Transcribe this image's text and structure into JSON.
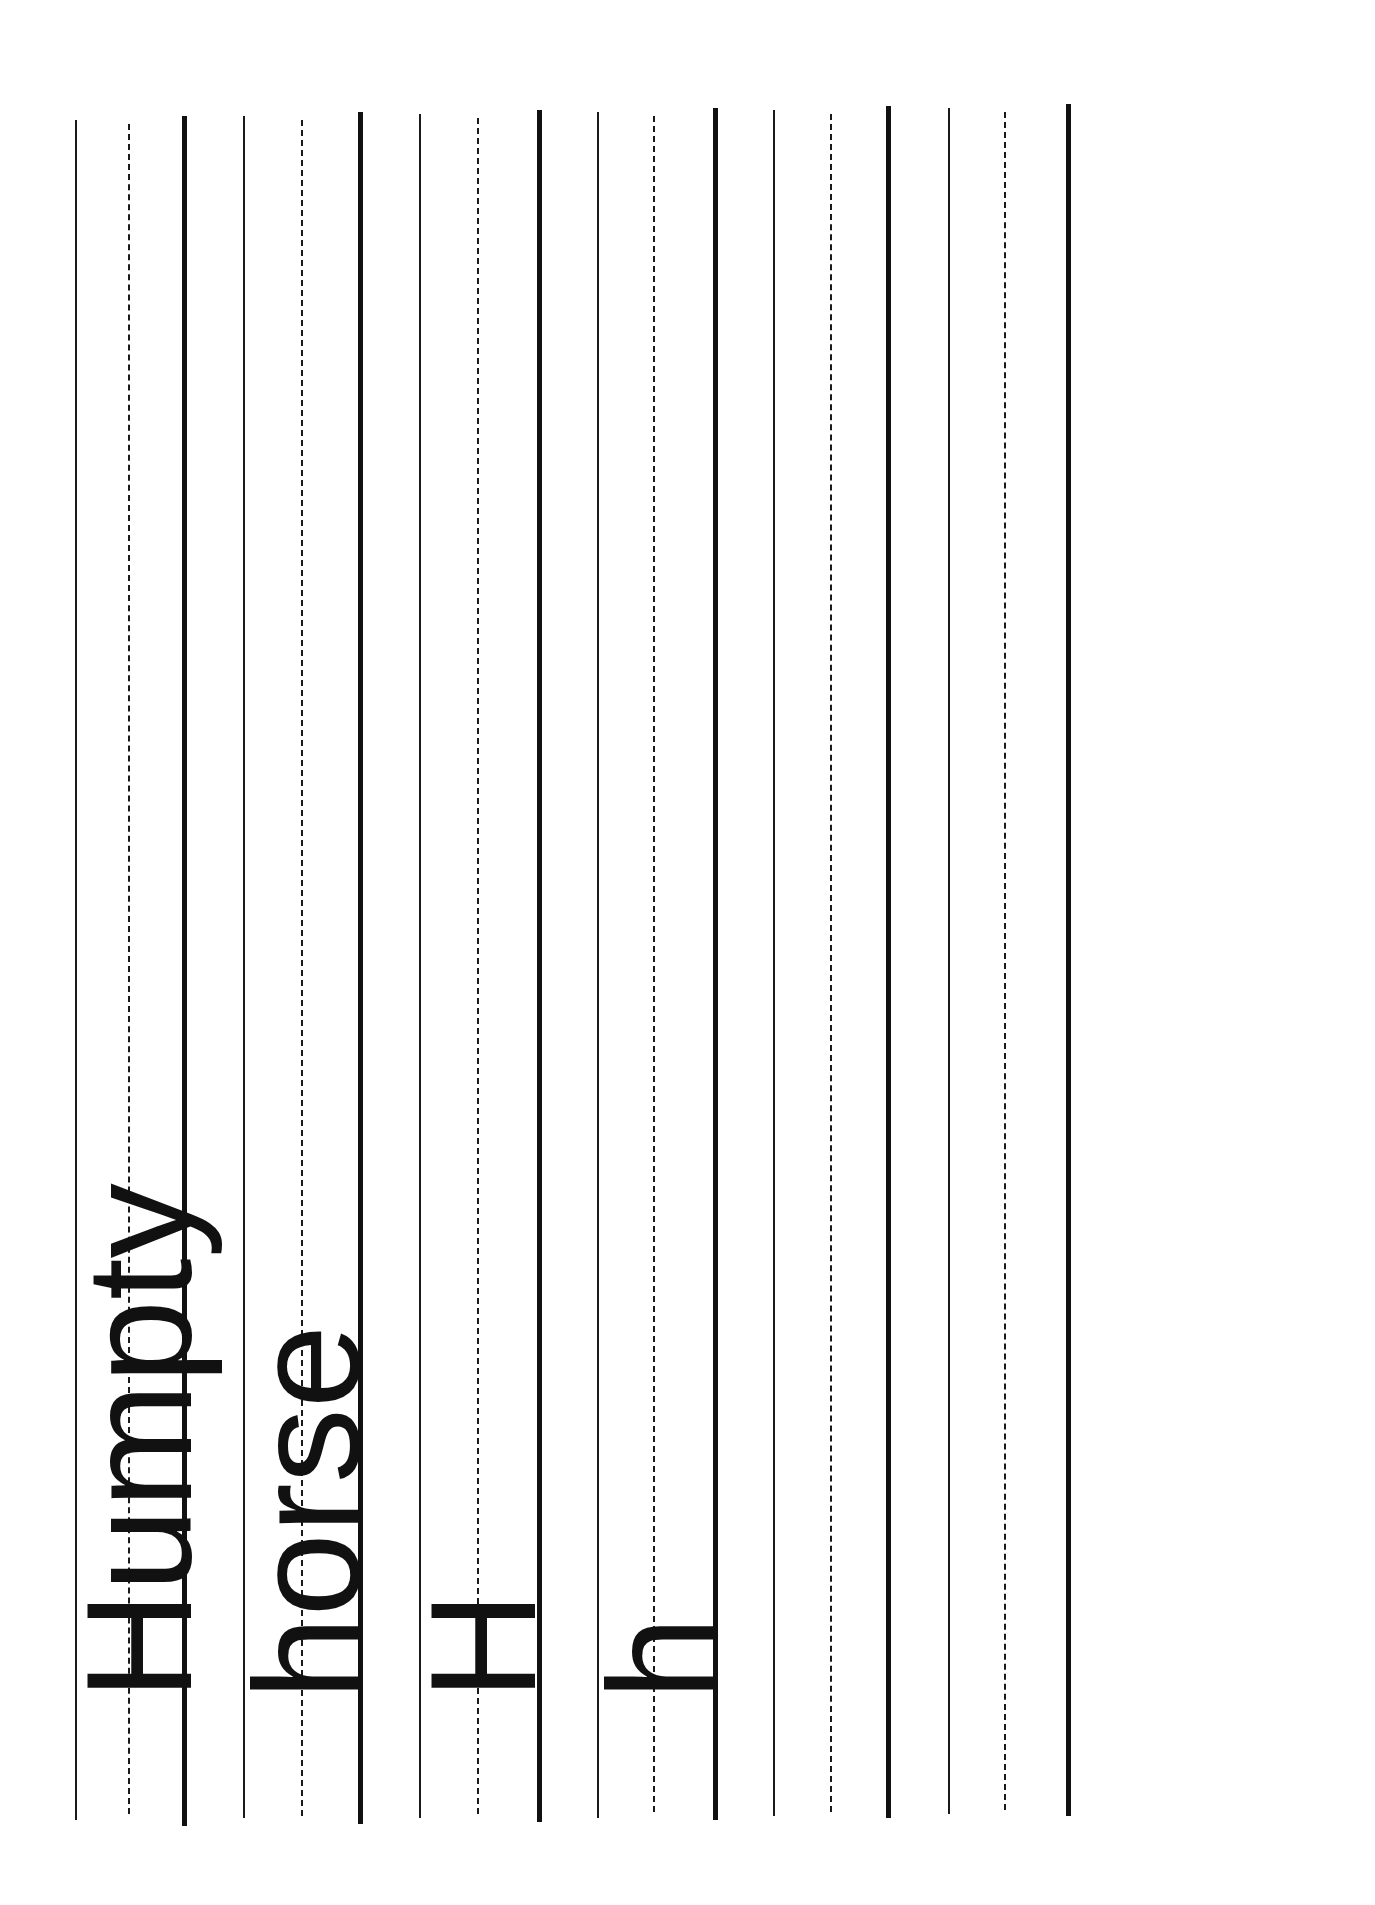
{
  "worksheet": {
    "orientation": "rotated-90-ccw",
    "rows": [
      {
        "id": "row-1",
        "model_text": "Humpty",
        "lines": {
          "top": 75,
          "mid": 129,
          "base": 186
        }
      },
      {
        "id": "row-2",
        "model_text": "horse",
        "lines": {
          "top": 243,
          "mid": 302,
          "base": 362
        }
      },
      {
        "id": "row-3",
        "model_text": "H",
        "lines": {
          "top": 419,
          "mid": 478,
          "base": 541
        }
      },
      {
        "id": "row-4",
        "model_text": "h",
        "lines": {
          "top": 597,
          "mid": 654,
          "base": 717
        }
      },
      {
        "id": "row-5",
        "model_text": "",
        "lines": {
          "top": 773,
          "mid": 830,
          "base": 890
        }
      },
      {
        "id": "row-6",
        "model_text": "",
        "lines": {
          "top": 948,
          "mid": 1005,
          "base": 1070
        }
      }
    ]
  },
  "colors": {
    "ink": "#111111",
    "paper": "#ffffff"
  }
}
